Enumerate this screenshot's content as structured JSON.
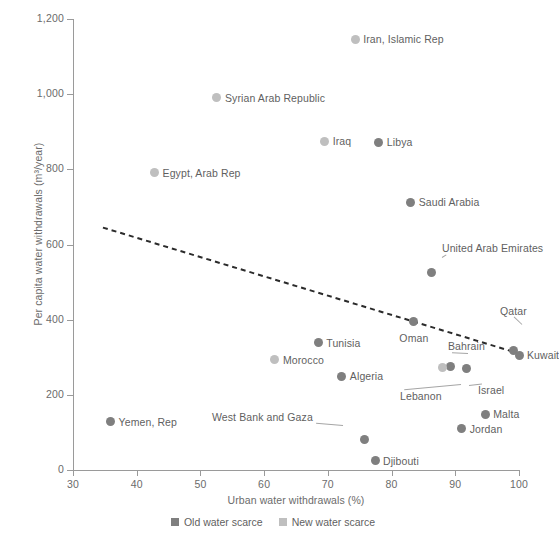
{
  "chart_data": {
    "type": "scatter",
    "title": "",
    "xlabel": "Urban water withdrawals (%)",
    "ylabel": "Per capita water withdrawals (m³/year)",
    "xlim": [
      30,
      100
    ],
    "ylim": [
      0,
      1200
    ],
    "xticks": [
      "30",
      "40",
      "50",
      "60",
      "70",
      "80",
      "90",
      "100"
    ],
    "xtick_values": [
      30,
      40,
      50,
      60,
      70,
      80,
      90,
      100
    ],
    "yticks": [
      "0",
      "200",
      "400",
      "600",
      "800",
      "1,000",
      "1,200"
    ],
    "ytick_values": [
      0,
      200,
      400,
      600,
      800,
      1000,
      1200
    ],
    "grid": false,
    "legend_position": "bottom-center",
    "series": [
      {
        "name": "Old water scarce",
        "color": "#7f7f7f",
        "marker": "circle"
      },
      {
        "name": "New water scarce",
        "color": "#bfbfbf",
        "marker": "circle"
      }
    ],
    "points": [
      {
        "label": "Iran, Islamic Rep",
        "x": 74.3,
        "y": 1146,
        "group": "new",
        "label_pos": "right"
      },
      {
        "label": "Syrian Arab Republic",
        "x": 52.6,
        "y": 991,
        "group": "new",
        "label_pos": "right"
      },
      {
        "label": "Iraq",
        "x": 69.5,
        "y": 875,
        "group": "new",
        "label_pos": "right"
      },
      {
        "label": "Libya",
        "x": 78.0,
        "y": 872,
        "group": "old",
        "label_pos": "right"
      },
      {
        "label": "Egypt, Arab Rep",
        "x": 42.8,
        "y": 791,
        "group": "new",
        "label_pos": "right"
      },
      {
        "label": "Saudi Arabia",
        "x": 83.0,
        "y": 713,
        "group": "old",
        "label_pos": "right"
      },
      {
        "label": "United Arab Emirates",
        "x": 86.3,
        "y": 525,
        "group": "old",
        "label_pos": "leader"
      },
      {
        "label": "Oman",
        "x": 83.5,
        "y": 394,
        "group": "old",
        "label_pos": "below"
      },
      {
        "label": "Qatar",
        "x": 99.2,
        "y": 318,
        "group": "old",
        "label_pos": "leader"
      },
      {
        "label": "Kuwait",
        "x": 100.0,
        "y": 305,
        "group": "old",
        "label_pos": "right"
      },
      {
        "label": "Tunisia",
        "x": 68.5,
        "y": 338,
        "group": "old",
        "label_pos": "right"
      },
      {
        "label": "Morocco",
        "x": 61.7,
        "y": 293,
        "group": "new",
        "label_pos": "right"
      },
      {
        "label": "Bahrain",
        "x": 89.2,
        "y": 275,
        "group": "old",
        "label_pos": "leader"
      },
      {
        "label": "Lebanon",
        "x": 88.0,
        "y": 272,
        "group": "new",
        "label_pos": "leader"
      },
      {
        "label": "Israel",
        "x": 91.8,
        "y": 270,
        "group": "old",
        "label_pos": "leader"
      },
      {
        "label": "Algeria",
        "x": 72.2,
        "y": 250,
        "group": "old",
        "label_pos": "right"
      },
      {
        "label": "Malta",
        "x": 94.7,
        "y": 148,
        "group": "old",
        "label_pos": "right"
      },
      {
        "label": "Jordan",
        "x": 91.0,
        "y": 110,
        "group": "old",
        "label_pos": "right"
      },
      {
        "label": "Yemen, Rep",
        "x": 35.9,
        "y": 128,
        "group": "old",
        "label_pos": "right"
      },
      {
        "label": "West Bank and Gaza",
        "x": 75.8,
        "y": 82,
        "group": "old",
        "label_pos": "leader"
      },
      {
        "label": "Djibouti",
        "x": 77.4,
        "y": 25,
        "group": "old",
        "label_pos": "right"
      }
    ],
    "trend_line": {
      "style": "dashed",
      "color": "#2b2b2b",
      "x_start": 34.7,
      "y_start": 645,
      "x_end": 100.0,
      "y_end": 310
    }
  },
  "legend": {
    "items": [
      {
        "label": "Old water scarce",
        "color": "#7f7f7f"
      },
      {
        "label": "New water scarce",
        "color": "#bfbfbf"
      }
    ]
  }
}
